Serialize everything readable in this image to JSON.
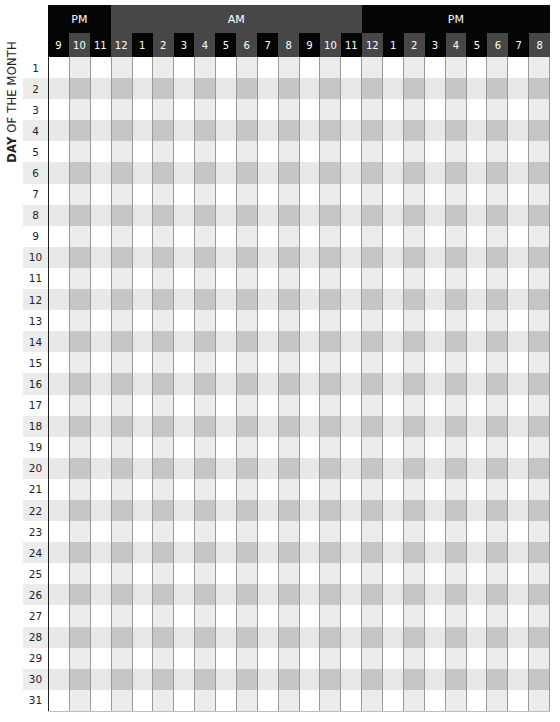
{
  "side_label": {
    "bold": "DAY",
    "rest": " OF THE MONTH"
  },
  "header": {
    "periods": [
      {
        "label": "PM",
        "span": 3,
        "style": "dark"
      },
      {
        "label": "AM",
        "span": 12,
        "style": "mid"
      },
      {
        "label": "PM",
        "span": 9,
        "style": "dark"
      }
    ],
    "hours": [
      {
        "label": "9",
        "shade": "black"
      },
      {
        "label": "10",
        "shade": "gray"
      },
      {
        "label": "11",
        "shade": "black"
      },
      {
        "label": "12",
        "shade": "gray"
      },
      {
        "label": "1",
        "shade": "black"
      },
      {
        "label": "2",
        "shade": "gray"
      },
      {
        "label": "3",
        "shade": "black"
      },
      {
        "label": "4",
        "shade": "gray"
      },
      {
        "label": "5",
        "shade": "black"
      },
      {
        "label": "6",
        "shade": "gray"
      },
      {
        "label": "7",
        "shade": "black"
      },
      {
        "label": "8",
        "shade": "gray"
      },
      {
        "label": "9",
        "shade": "black"
      },
      {
        "label": "10",
        "shade": "gray"
      },
      {
        "label": "11",
        "shade": "black"
      },
      {
        "label": "12",
        "shade": "gray"
      },
      {
        "label": "1",
        "shade": "black"
      },
      {
        "label": "2",
        "shade": "gray"
      },
      {
        "label": "3",
        "shade": "black"
      },
      {
        "label": "4",
        "shade": "gray"
      },
      {
        "label": "5",
        "shade": "black"
      },
      {
        "label": "6",
        "shade": "gray"
      },
      {
        "label": "7",
        "shade": "black"
      },
      {
        "label": "8",
        "shade": "gray"
      }
    ]
  },
  "days": [
    "1",
    "2",
    "3",
    "4",
    "5",
    "6",
    "7",
    "8",
    "9",
    "10",
    "11",
    "12",
    "13",
    "14",
    "15",
    "16",
    "17",
    "18",
    "19",
    "20",
    "21",
    "22",
    "23",
    "24",
    "25",
    "26",
    "27",
    "28",
    "29",
    "30",
    "31"
  ],
  "colors": {
    "header_black": "#050505",
    "header_gray": "#474747",
    "cell_white": "#ffffff",
    "cell_light": "#ececec",
    "cell_mid": "#c6c6c6",
    "grid_line": "#9a9a9a"
  }
}
